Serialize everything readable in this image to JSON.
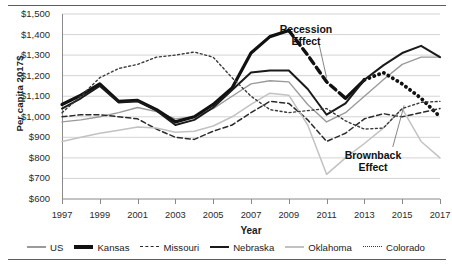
{
  "chart_data": {
    "type": "line",
    "title": "",
    "xlabel": "Year",
    "ylabel": "Per capita 2017$",
    "xlim": [
      1997,
      2017
    ],
    "ylim": [
      600,
      1500
    ],
    "grid": true,
    "legend_position": "bottom",
    "ytick_labels": [
      "$1,500",
      "$1,400",
      "$1,300",
      "$1,200",
      "$1,100",
      "$1,000",
      "$900",
      "$800",
      "$700",
      "$600"
    ],
    "ytick_values": [
      1500,
      1400,
      1300,
      1200,
      1100,
      1000,
      900,
      800,
      700,
      600
    ],
    "xtick_labels": [
      "1997",
      "1999",
      "2001",
      "2003",
      "2005",
      "2007",
      "2009",
      "2011",
      "2013",
      "2015",
      "2017"
    ],
    "xtick_values": [
      1997,
      1999,
      2001,
      2003,
      2005,
      2007,
      2009,
      2011,
      2013,
      2015,
      2017
    ],
    "x": [
      1997,
      1998,
      1999,
      2000,
      2001,
      2002,
      2003,
      2004,
      2005,
      2006,
      2007,
      2008,
      2009,
      2010,
      2011,
      2012,
      2013,
      2014,
      2015,
      2016,
      2017
    ],
    "series": [
      {
        "name": "US",
        "color": "#9a9a9a",
        "width": 1.4,
        "dash": "none",
        "values": [
          975,
          985,
          1000,
          1020,
          1045,
          1025,
          990,
          1000,
          1040,
          1100,
          1160,
          1175,
          1170,
          1060,
          975,
          1020,
          1100,
          1180,
          1255,
          1290,
          1290
        ]
      },
      {
        "name": "Kansas",
        "color": "#111111",
        "width": 3.2,
        "dash": "none",
        "values": [
          1060,
          1105,
          1160,
          1075,
          1080,
          1035,
          975,
          1000,
          1060,
          1140,
          1310,
          1390,
          1420,
          1300,
          1170,
          1090,
          1180,
          1215,
          1160,
          1090,
          1000
        ]
      },
      {
        "name": "Missouri",
        "color": "#2b2b2b",
        "width": 1.5,
        "dash": "5,3",
        "values": [
          1000,
          1010,
          1010,
          1000,
          990,
          940,
          900,
          890,
          930,
          960,
          1020,
          1075,
          1065,
          985,
          880,
          920,
          990,
          1015,
          1000,
          1020,
          1040
        ]
      },
      {
        "name": "Nebraska",
        "color": "#1a1a1a",
        "width": 2.0,
        "dash": "none",
        "values": [
          1040,
          1090,
          1150,
          1070,
          1075,
          1030,
          960,
          985,
          1045,
          1130,
          1215,
          1225,
          1225,
          1135,
          1010,
          1065,
          1180,
          1250,
          1310,
          1345,
          1290
        ]
      },
      {
        "name": "Oklahoma",
        "color": "#c2c2c2",
        "width": 1.5,
        "dash": "none",
        "values": [
          880,
          900,
          920,
          935,
          950,
          945,
          925,
          930,
          955,
          1000,
          1060,
          1115,
          1105,
          960,
          720,
          800,
          870,
          945,
          1040,
          880,
          800
        ]
      },
      {
        "name": "Colorado",
        "color": "#3a3a3a",
        "width": 1.4,
        "dash": "2,2.6",
        "values": [
          1020,
          1100,
          1190,
          1235,
          1255,
          1290,
          1300,
          1315,
          1290,
          1190,
          1100,
          1035,
          1020,
          1030,
          1040,
          980,
          940,
          945,
          1040,
          1070,
          1075
        ]
      }
    ],
    "kansas_emphasis": {
      "recession_segment": {
        "note": "Kansas thick dashed segment 2009-2012",
        "x": [
          2009,
          2010,
          2011,
          2012
        ],
        "values": [
          1420,
          1300,
          1170,
          1090
        ]
      },
      "brownback_segment": {
        "note": "Kansas thick dotted segment 2013-2017",
        "x": [
          2013,
          2014,
          2015,
          2016,
          2017
        ],
        "values": [
          1180,
          1215,
          1160,
          1090,
          1000
        ]
      }
    },
    "annotations": [
      {
        "name": "recession-effect",
        "text": "Recession\nEffect",
        "line1": "Recession",
        "line2": "Effect",
        "points_to_x": 2011,
        "points_to_y": 1200
      },
      {
        "name": "brownback-effect",
        "text": "Brownback\nEffect",
        "line1": "Brownback",
        "line2": "Effect",
        "points_to_x": 2015,
        "points_to_y": 1000
      }
    ],
    "legend": [
      {
        "label": "US"
      },
      {
        "label": "Kansas"
      },
      {
        "label": "Missouri"
      },
      {
        "label": "Nebraska"
      },
      {
        "label": "Oklahoma"
      },
      {
        "label": "Colorado"
      }
    ]
  }
}
